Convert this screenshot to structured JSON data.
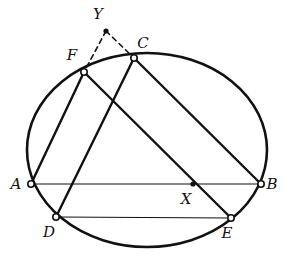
{
  "figure": {
    "kind": "geometry-diagram",
    "title": "",
    "width": 289,
    "height": 258,
    "background_color": "#ffffff",
    "ink_color": "#111111"
  },
  "conic": {
    "name": "circumscribing-ellipse",
    "type": "ellipse",
    "cx": 147,
    "cy": 150,
    "rx": 120,
    "ry": 97,
    "stroke_width": 2.6,
    "fill": "none"
  },
  "points": [
    {
      "id": "A",
      "label": "A",
      "x": 31,
      "y": 184,
      "marker": "open-circle",
      "label_x": 16,
      "label_y": 189
    },
    {
      "id": "B",
      "label": "B",
      "x": 261,
      "y": 184,
      "marker": "open-circle",
      "label_x": 272,
      "label_y": 189
    },
    {
      "id": "C",
      "label": "C",
      "x": 134,
      "y": 58,
      "marker": "open-circle",
      "label_x": 143,
      "label_y": 48
    },
    {
      "id": "D",
      "label": "D",
      "x": 56,
      "y": 217,
      "marker": "open-circle",
      "label_x": 49,
      "label_y": 237
    },
    {
      "id": "E",
      "label": "E",
      "x": 231,
      "y": 218,
      "marker": "open-circle",
      "label_x": 227,
      "label_y": 238
    },
    {
      "id": "F",
      "label": "F",
      "x": 84,
      "y": 72,
      "marker": "open-circle",
      "label_x": 72,
      "label_y": 60
    },
    {
      "id": "X",
      "label": "X",
      "x": 193,
      "y": 184,
      "marker": "filled-dot",
      "label_x": 186,
      "label_y": 204
    },
    {
      "id": "Y",
      "label": "Y",
      "x": 106,
      "y": 31,
      "marker": "filled-dot",
      "label_x": 98,
      "label_y": 19
    }
  ],
  "segments": [
    {
      "id": "AB",
      "from": "A",
      "to": "B",
      "style": "solid",
      "stroke_width": 1.2
    },
    {
      "id": "DE",
      "from": "D",
      "to": "E",
      "style": "solid",
      "stroke_width": 1.2
    },
    {
      "id": "AF",
      "from": "A",
      "to": "F",
      "style": "solid",
      "stroke_width": 2.4
    },
    {
      "id": "CB",
      "from": "C",
      "to": "B",
      "style": "solid",
      "stroke_width": 2.4
    },
    {
      "id": "CD",
      "from": "C",
      "to": "D",
      "style": "solid",
      "stroke_width": 2.4
    },
    {
      "id": "FE",
      "from": "F",
      "to": "E",
      "style": "solid",
      "stroke_width": 2.4
    },
    {
      "id": "YF",
      "from": "Y",
      "to": "F",
      "style": "dashed",
      "stroke_width": 1.6
    },
    {
      "id": "YC",
      "from": "Y",
      "to": "C",
      "style": "dashed",
      "stroke_width": 1.6
    }
  ],
  "markers": {
    "open_circle_radius": 3.2,
    "open_circle_fill": "#ffffff",
    "filled_dot_radius": 2.6,
    "dash_pattern": "5,4"
  }
}
